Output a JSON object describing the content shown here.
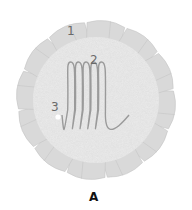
{
  "figure": {
    "caption": "A",
    "labels": [
      {
        "id": "1",
        "text": "1",
        "x": 67,
        "y": 25
      },
      {
        "id": "2",
        "text": "2",
        "x": 90,
        "y": 54
      },
      {
        "id": "3",
        "text": "3",
        "x": 51,
        "y": 101
      }
    ],
    "disk": {
      "center": [
        96,
        100
      ],
      "inner_radius": 62,
      "outer_radius": 82,
      "lobe_count": 12,
      "lobe_color": "#d9d9d9",
      "lobe_edge_color": "#c4c4c4",
      "inner_color": "#ebebeb"
    },
    "coil": {
      "loops": 5,
      "color": "#9a9a9a",
      "x_start": 62,
      "x_end": 129,
      "top_y": 62,
      "bottom_y": 135
    },
    "marker": {
      "x": 58,
      "y": 117,
      "color": "#ffffff"
    }
  }
}
